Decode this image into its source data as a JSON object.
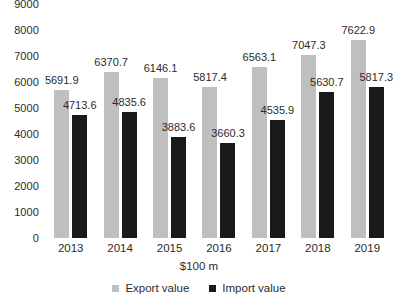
{
  "chart_data": {
    "type": "bar",
    "title": "",
    "xlabel": "$100 m",
    "ylabel": "",
    "categories": [
      "2013",
      "2014",
      "2015",
      "2016",
      "2017",
      "2018",
      "2019"
    ],
    "series": [
      {
        "name": "Export value",
        "color": "#bfbfbf",
        "values": [
          5691.9,
          6370.7,
          6146.1,
          5817.4,
          6563.1,
          7047.3,
          7622.9
        ]
      },
      {
        "name": "Import value",
        "color": "#1a1a1a",
        "values": [
          4713.6,
          4835.6,
          3883.6,
          3660.3,
          4535.9,
          5630.7,
          5817.3
        ]
      }
    ],
    "ylim": [
      0,
      9000
    ],
    "yticks": [
      0,
      1000,
      2000,
      3000,
      4000,
      5000,
      6000,
      7000,
      8000,
      9000
    ],
    "ytick_labels": [
      "0",
      "1000",
      "2000",
      "3000",
      "4000",
      "5000",
      "6000",
      "7000",
      "8000",
      "9000"
    ],
    "grid": false,
    "data_labels": true,
    "legend_position": "bottom",
    "legend": [
      "Export value",
      "Import value"
    ]
  }
}
